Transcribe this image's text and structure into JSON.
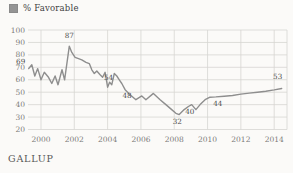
{
  "legend": {
    "label": "% Favorable"
  },
  "source": "GALLUP",
  "colors": {
    "background": "#fbfaf8",
    "grid": "#d7d5d2",
    "line": "#8e8e8e",
    "tick_label": "#7c7b78",
    "data_label": "#4c4c4c",
    "legend_swatch": "#949494"
  },
  "chart_data": {
    "type": "line",
    "title": "% Favorable",
    "xlabel": "",
    "ylabel": "",
    "legend_position": "top-left",
    "grid": true,
    "xlim": [
      1999.22,
      2014.77
    ],
    "ylim": [
      20,
      100
    ],
    "x_ticks": [
      2000,
      2002,
      2004,
      2006,
      2008,
      2010,
      2012,
      2014
    ],
    "y_ticks": [
      100,
      90,
      80,
      70,
      60,
      50,
      40,
      30,
      20
    ],
    "series": [
      {
        "name": "% Favorable",
        "points": [
          [
            1999.26,
            69
          ],
          [
            1999.45,
            72
          ],
          [
            1999.63,
            63
          ],
          [
            1999.8,
            69
          ],
          [
            2000.0,
            60
          ],
          [
            2000.2,
            66
          ],
          [
            2000.45,
            62
          ],
          [
            2000.65,
            57
          ],
          [
            2000.85,
            63
          ],
          [
            2001.02,
            56
          ],
          [
            2001.26,
            68
          ],
          [
            2001.42,
            60
          ],
          [
            2001.7,
            87
          ],
          [
            2001.85,
            82
          ],
          [
            2002.05,
            78
          ],
          [
            2002.25,
            77
          ],
          [
            2002.45,
            76
          ],
          [
            2002.7,
            74
          ],
          [
            2002.9,
            73
          ],
          [
            2003.05,
            68
          ],
          [
            2003.2,
            65
          ],
          [
            2003.35,
            67
          ],
          [
            2003.55,
            64
          ],
          [
            2003.7,
            62
          ],
          [
            2003.85,
            66
          ],
          [
            2004.0,
            54
          ],
          [
            2004.12,
            58
          ],
          [
            2004.25,
            56
          ],
          [
            2004.4,
            65
          ],
          [
            2004.55,
            63
          ],
          [
            2004.7,
            60
          ],
          [
            2004.85,
            57
          ],
          [
            2005.05,
            52
          ],
          [
            2005.35,
            48
          ],
          [
            2005.7,
            44
          ],
          [
            2006.05,
            47
          ],
          [
            2006.3,
            44
          ],
          [
            2006.75,
            49
          ],
          [
            2007.15,
            44
          ],
          [
            2007.5,
            40
          ],
          [
            2007.85,
            36
          ],
          [
            2008.1,
            33
          ],
          [
            2008.3,
            32
          ],
          [
            2008.6,
            36
          ],
          [
            2008.85,
            38.5
          ],
          [
            2009.05,
            40
          ],
          [
            2009.3,
            36
          ],
          [
            2009.55,
            40
          ],
          [
            2009.85,
            44
          ],
          [
            2010.15,
            46
          ],
          [
            2010.5,
            46.2
          ],
          [
            2011.0,
            46.8
          ],
          [
            2011.5,
            47.3
          ],
          [
            2012.0,
            48.5
          ],
          [
            2012.5,
            49.3
          ],
          [
            2013.0,
            50
          ],
          [
            2013.5,
            50.8
          ],
          [
            2014.0,
            51.8
          ],
          [
            2014.45,
            53
          ]
        ]
      }
    ],
    "point_labels": [
      {
        "x": 1999.26,
        "y": 69,
        "label": "69",
        "dx": -8,
        "dy": -5
      },
      {
        "x": 2001.7,
        "y": 87,
        "label": "87",
        "dx": 0,
        "dy": -8
      },
      {
        "x": 2004.0,
        "y": 54,
        "label": "54",
        "dx": 1,
        "dy": -7
      },
      {
        "x": 2005.35,
        "y": 48,
        "label": "48",
        "dx": -3,
        "dy": 3
      },
      {
        "x": 2008.3,
        "y": 32,
        "label": "32",
        "dx": -2,
        "dy": 9
      },
      {
        "x": 2009.05,
        "y": 40,
        "label": "40",
        "dx": -2,
        "dy": 9
      },
      {
        "x": 2010.5,
        "y": 46.2,
        "label": "44",
        "dx": 2,
        "dy": 9
      },
      {
        "x": 2014.45,
        "y": 53,
        "label": "53",
        "dx": -4,
        "dy": -9
      }
    ]
  }
}
